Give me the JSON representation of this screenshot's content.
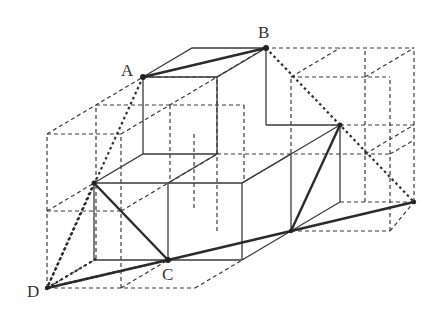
{
  "figure": {
    "type": "isometric cube stack diagram",
    "labels": {
      "A": "A",
      "B": "B",
      "C": "C",
      "D": "D"
    },
    "points": {
      "A": [
        142,
        77
      ],
      "B": [
        265,
        48
      ],
      "C": [
        168,
        260
      ],
      "D": [
        47,
        288
      ]
    },
    "colors": {
      "line": "#3a3a3a",
      "background": "#ffffff"
    }
  }
}
